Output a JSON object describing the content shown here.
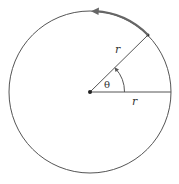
{
  "diagram": {
    "labels": {
      "radius_top": "r",
      "radius_bottom": "r",
      "angle": "θ"
    },
    "colors": {
      "stroke": "#555555",
      "arc": "#666666",
      "text": "#333333"
    }
  }
}
